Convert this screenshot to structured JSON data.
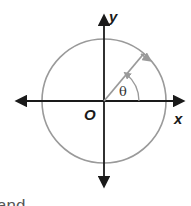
{
  "diagram": {
    "labels": {
      "y_axis": "y",
      "x_axis": "x",
      "origin": "O",
      "angle": "θ",
      "partial_text": "and"
    },
    "colors": {
      "axis": "#1a1a1a",
      "circle": "#9a9a9a",
      "radius": "#9a9a9a",
      "arc": "#9a9a9a"
    },
    "geometry": {
      "origin": [
        104,
        101
      ],
      "circle_radius": 62,
      "angle_degrees": 50
    }
  }
}
